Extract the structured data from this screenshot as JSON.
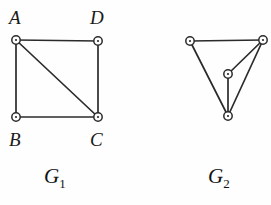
{
  "figure": {
    "background_color": "#fefefe",
    "ink_color": "#2b2b2b",
    "vertex_fill": "#ffffff",
    "width": 271,
    "height": 205
  },
  "graphs": [
    {
      "id": "g1",
      "caption_symbol": "G",
      "caption_subscript": "1",
      "vertices": [
        {
          "id": "A",
          "label": "A",
          "x": 16,
          "y": 40,
          "label_x": 9,
          "label_y": 8
        },
        {
          "id": "D",
          "label": "D",
          "x": 98,
          "y": 41,
          "label_x": 90,
          "label_y": 8
        },
        {
          "id": "B",
          "label": "B",
          "x": 16,
          "y": 117,
          "label_x": 9,
          "label_y": 130
        },
        {
          "id": "C",
          "label": "C",
          "x": 98,
          "y": 117,
          "label_x": 90,
          "label_y": 130
        }
      ],
      "edges": [
        {
          "from": "A",
          "to": "D"
        },
        {
          "from": "A",
          "to": "B"
        },
        {
          "from": "A",
          "to": "C"
        },
        {
          "from": "B",
          "to": "C"
        },
        {
          "from": "D",
          "to": "C"
        }
      ]
    },
    {
      "id": "g2",
      "caption_symbol": "G",
      "caption_subscript": "2",
      "vertices": [
        {
          "id": "v1",
          "label": "",
          "x": 190,
          "y": 41
        },
        {
          "id": "v2",
          "label": "",
          "x": 263,
          "y": 40
        },
        {
          "id": "v3",
          "label": "",
          "x": 228,
          "y": 74
        },
        {
          "id": "v4",
          "label": "",
          "x": 228,
          "y": 116
        }
      ],
      "edges": [
        {
          "from": "v1",
          "to": "v2"
        },
        {
          "from": "v1",
          "to": "v4"
        },
        {
          "from": "v2",
          "to": "v4"
        },
        {
          "from": "v2",
          "to": "v3"
        },
        {
          "from": "v3",
          "to": "v4"
        }
      ]
    }
  ],
  "labels": {
    "A": "A",
    "B": "B",
    "C": "C",
    "D": "D"
  },
  "captions": {
    "g1_symbol": "G",
    "g1_subscript": "1",
    "g2_symbol": "G",
    "g2_subscript": "2"
  }
}
